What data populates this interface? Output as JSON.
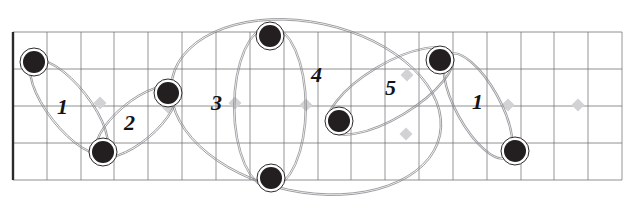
{
  "figure": {
    "type": "diagram",
    "title": "",
    "background": "#ffffff",
    "width": 633,
    "height": 212
  },
  "grid": {
    "line_color": "#6f6f73",
    "border_color": "#2a2a2a",
    "x_start": 13,
    "x_end": 622,
    "y_start": 32,
    "y_end": 180,
    "column_step": 33.8,
    "row_step": 37,
    "vertical_lines": [
      13,
      47,
      81,
      114,
      148,
      182,
      216,
      250,
      284,
      318,
      351,
      385,
      419,
      453,
      487,
      521,
      554,
      588,
      622
    ],
    "horizontal_lines": [
      32,
      69,
      106,
      143,
      180
    ],
    "left_border_bold": true
  },
  "nodes": {
    "fill": "#231f20",
    "ring": "#ffffff",
    "ring_stroke": "#2b2b2b",
    "radius": 11,
    "ring_radius": 14,
    "items": [
      {
        "id": "n1",
        "cx": 34,
        "cy": 62,
        "label": "node-1"
      },
      {
        "id": "n2",
        "cx": 103,
        "cy": 152,
        "label": "node-2"
      },
      {
        "id": "n3",
        "cx": 168,
        "cy": 93,
        "label": "node-3"
      },
      {
        "id": "n4",
        "cx": 270,
        "cy": 36,
        "label": "node-4"
      },
      {
        "id": "n5",
        "cx": 271,
        "cy": 178,
        "label": "node-5"
      },
      {
        "id": "n6",
        "cx": 339,
        "cy": 121,
        "label": "node-6"
      },
      {
        "id": "n7",
        "cx": 440,
        "cy": 60,
        "label": "node-7"
      },
      {
        "id": "n8",
        "cx": 515,
        "cy": 151,
        "label": "node-8"
      }
    ]
  },
  "diamonds": {
    "fill": "#d2d2d4",
    "size": 13,
    "items": [
      {
        "cx": 100,
        "cy": 103
      },
      {
        "cx": 168,
        "cy": 107
      },
      {
        "cx": 235,
        "cy": 103
      },
      {
        "cx": 306,
        "cy": 105
      },
      {
        "cx": 407,
        "cy": 75
      },
      {
        "cx": 406,
        "cy": 134
      },
      {
        "cx": 508,
        "cy": 105
      },
      {
        "cx": 578,
        "cy": 105
      }
    ]
  },
  "lassos": {
    "stroke": "#8a8a8f",
    "stroke_width": 0.9,
    "items": [
      {
        "name": "lasso-1",
        "cx": 69,
        "cy": 107,
        "rx": 56,
        "ry": 20,
        "rot": 52
      },
      {
        "name": "lasso-2",
        "cx": 136,
        "cy": 122,
        "rx": 49,
        "ry": 19,
        "rot": -40
      },
      {
        "name": "lasso-3",
        "cx": 270,
        "cy": 107,
        "rx": 80,
        "ry": 35,
        "rot": 90
      },
      {
        "name": "lasso-4",
        "cx": 306,
        "cy": 107,
        "rx": 136,
        "ry": 84,
        "rot": 12
      },
      {
        "name": "lasso-5",
        "cx": 390,
        "cy": 91,
        "rx": 71,
        "ry": 26,
        "rot": -31
      },
      {
        "name": "lasso-6",
        "cx": 478,
        "cy": 106,
        "rx": 58,
        "ry": 21,
        "rot": 61
      }
    ]
  },
  "labels": {
    "color": "#141414",
    "items": [
      {
        "text": "1",
        "x": 57,
        "y": 96,
        "size": 22,
        "name": "cluster-label-1"
      },
      {
        "text": "2",
        "x": 124,
        "y": 112,
        "size": 22,
        "name": "cluster-label-2"
      },
      {
        "text": "3",
        "x": 211,
        "y": 92,
        "size": 22,
        "name": "cluster-label-3"
      },
      {
        "text": "4",
        "x": 311,
        "y": 64,
        "size": 22,
        "name": "cluster-label-4"
      },
      {
        "text": "5",
        "x": 385,
        "y": 77,
        "size": 22,
        "name": "cluster-label-5"
      },
      {
        "text": "1",
        "x": 472,
        "y": 91,
        "size": 22,
        "name": "cluster-label-6"
      }
    ]
  }
}
